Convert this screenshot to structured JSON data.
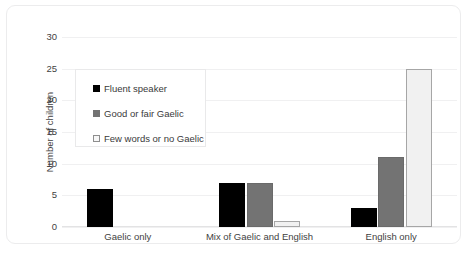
{
  "chart_data": {
    "type": "bar",
    "title": "",
    "xlabel": "",
    "ylabel": "Number of children",
    "ylim": [
      0,
      30
    ],
    "yticks": [
      0,
      5,
      10,
      15,
      20,
      25,
      30
    ],
    "grid": true,
    "legend_position": "upper left (inside plot)",
    "categories": [
      "Gaelic only",
      "Mix of Gaelic and English",
      "English only"
    ],
    "series": [
      {
        "name": "Fluent speaker",
        "color": "#000000",
        "values": [
          6,
          7,
          3
        ]
      },
      {
        "name": "Good or fair Gaelic",
        "color": "#737373",
        "values": [
          0,
          7,
          11
        ]
      },
      {
        "name": "Few words or no Gaelic",
        "color": "#f1f1f1",
        "values": [
          0,
          1,
          25
        ]
      }
    ]
  },
  "axis": {
    "y_title": "Number of children",
    "y_tick_labels": [
      "0",
      "5",
      "10",
      "15",
      "20",
      "25",
      "30"
    ],
    "x_tick_labels": [
      "Gaelic only",
      "Mix of Gaelic and English",
      "English only"
    ]
  },
  "legend": {
    "items": [
      {
        "label": "Fluent speaker",
        "swatch": "fluent"
      },
      {
        "label": "Good or fair Gaelic",
        "swatch": "good"
      },
      {
        "label": "Few words or no Gaelic",
        "swatch": "few"
      }
    ]
  }
}
